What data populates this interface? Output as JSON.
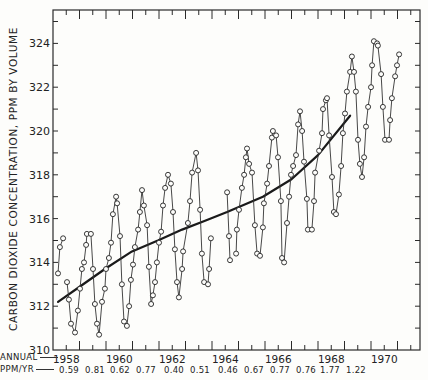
{
  "chart_data": {
    "type": "line",
    "title": "",
    "ylabel": "CARBON DIOXIDE CONCENTRATION, PPM BY VOLUME",
    "xlabel": "",
    "ylim": [
      310,
      325.5
    ],
    "xlim": [
      1958.0,
      1971.85
    ],
    "yticks": [
      310,
      312,
      314,
      316,
      318,
      320,
      322,
      324
    ],
    "xtick_labels": [
      "1958",
      "1960",
      "1962",
      "1964",
      "1966",
      "1968",
      "1970"
    ],
    "bottom_rows": {
      "annual_label": "ANNUAL",
      "rate_label": "PPM/YR",
      "rates": [
        "0.59",
        "0.81",
        "0.62",
        "0.77",
        "0.40",
        "0.51",
        "0.46",
        "0.67",
        "0.77",
        "0.76",
        "1.77",
        "1.22"
      ]
    },
    "grid": false,
    "series": [
      {
        "name": "Monthly mean CO2 (Mauna Loa)",
        "style": "line-open-circles",
        "segments": [
          [
            [
              1958.19,
              313.5
            ],
            [
              1958.26,
              314.7
            ],
            [
              1958.38,
              315.1
            ]
          ],
          [
            [
              1958.53,
              313.1
            ],
            [
              1958.6,
              312.3
            ],
            [
              1958.68,
              311.2
            ],
            [
              1958.83,
              310.8
            ],
            [
              1958.94,
              311.8
            ],
            [
              1959.02,
              312.8
            ],
            [
              1959.09,
              313.7
            ],
            [
              1959.17,
              314.0
            ],
            [
              1959.25,
              314.8
            ],
            [
              1959.28,
              315.3
            ],
            [
              1959.43,
              315.3
            ],
            [
              1959.51,
              313.7
            ],
            [
              1959.58,
              312.1
            ],
            [
              1959.66,
              311.2
            ],
            [
              1959.74,
              310.7
            ],
            [
              1959.85,
              312.2
            ],
            [
              1959.96,
              312.8
            ],
            [
              1960.0,
              313.7
            ],
            [
              1960.11,
              314.2
            ],
            [
              1960.19,
              314.9
            ],
            [
              1960.26,
              316.2
            ],
            [
              1960.38,
              317.0
            ],
            [
              1960.42,
              316.7
            ],
            [
              1960.53,
              315.2
            ],
            [
              1960.6,
              313.0
            ],
            [
              1960.68,
              311.3
            ],
            [
              1960.79,
              311.1
            ],
            [
              1960.87,
              312.0
            ],
            [
              1960.94,
              313.2
            ],
            [
              1961.02,
              313.9
            ],
            [
              1961.09,
              314.7
            ],
            [
              1961.21,
              315.5
            ],
            [
              1961.28,
              316.3
            ],
            [
              1961.36,
              317.3
            ],
            [
              1961.43,
              316.6
            ],
            [
              1961.55,
              315.7
            ],
            [
              1961.62,
              313.8
            ],
            [
              1961.7,
              312.1
            ],
            [
              1961.77,
              312.5
            ],
            [
              1961.85,
              313.1
            ],
            [
              1961.92,
              314.0
            ],
            [
              1962.0,
              314.9
            ],
            [
              1962.08,
              315.4
            ],
            [
              1962.15,
              316.6
            ],
            [
              1962.23,
              317.4
            ],
            [
              1962.34,
              318.0
            ],
            [
              1962.45,
              317.6
            ],
            [
              1962.53,
              316.3
            ],
            [
              1962.6,
              314.6
            ],
            [
              1962.68,
              313.1
            ],
            [
              1962.75,
              312.4
            ],
            [
              1962.87,
              313.7
            ],
            [
              1962.91,
              314.5
            ],
            [
              1963.09,
              315.8
            ],
            [
              1963.17,
              316.8
            ],
            [
              1963.25,
              318.1
            ],
            [
              1963.4,
              319.0
            ],
            [
              1963.47,
              318.2
            ],
            [
              1963.55,
              316.4
            ],
            [
              1963.62,
              314.4
            ],
            [
              1963.7,
              313.1
            ],
            [
              1963.85,
              313.0
            ],
            [
              1963.89,
              313.7
            ],
            [
              1963.96,
              315.1
            ]
          ],
          [
            [
              1964.57,
              317.2
            ],
            [
              1964.64,
              315.2
            ],
            [
              1964.68,
              314.1
            ]
          ],
          [
            [
              1964.91,
              314.4
            ],
            [
              1964.94,
              315.5
            ],
            [
              1965.02,
              316.4
            ],
            [
              1965.13,
              317.4
            ],
            [
              1965.21,
              318.0
            ],
            [
              1965.28,
              318.8
            ],
            [
              1965.32,
              319.2
            ],
            [
              1965.4,
              318.5
            ],
            [
              1965.51,
              318.1
            ],
            [
              1965.62,
              315.7
            ],
            [
              1965.7,
              314.4
            ],
            [
              1965.81,
              314.3
            ],
            [
              1965.92,
              315.6
            ],
            [
              1965.96,
              316.7
            ],
            [
              1966.08,
              317.6
            ],
            [
              1966.15,
              318.4
            ],
            [
              1966.26,
              319.7
            ],
            [
              1966.3,
              320.0
            ],
            [
              1966.42,
              319.8
            ],
            [
              1966.49,
              318.8
            ],
            [
              1966.6,
              316.8
            ],
            [
              1966.64,
              314.2
            ],
            [
              1966.72,
              314.0
            ],
            [
              1966.83,
              315.8
            ],
            [
              1966.91,
              317.0
            ],
            [
              1966.98,
              318.0
            ],
            [
              1967.06,
              318.4
            ],
            [
              1967.17,
              318.9
            ],
            [
              1967.25,
              320.3
            ],
            [
              1967.32,
              320.9
            ],
            [
              1967.4,
              320.0
            ],
            [
              1967.47,
              318.6
            ],
            [
              1967.58,
              316.9
            ],
            [
              1967.62,
              315.5
            ],
            [
              1967.77,
              315.5
            ],
            [
              1967.85,
              316.8
            ],
            [
              1967.89,
              318.1
            ],
            [
              1968.04,
              319.1
            ],
            [
              1968.15,
              319.9
            ],
            [
              1968.19,
              321.0
            ],
            [
              1968.3,
              321.4
            ],
            [
              1968.34,
              321.5
            ],
            [
              1968.42,
              319.8
            ],
            [
              1968.53,
              317.9
            ],
            [
              1968.6,
              316.3
            ],
            [
              1968.68,
              316.2
            ],
            [
              1968.79,
              317.1
            ],
            [
              1968.87,
              318.4
            ],
            [
              1968.94,
              319.9
            ],
            [
              1969.02,
              320.8
            ],
            [
              1969.09,
              321.8
            ],
            [
              1969.21,
              322.7
            ],
            [
              1969.28,
              323.4
            ],
            [
              1969.36,
              322.7
            ],
            [
              1969.43,
              321.8
            ],
            [
              1969.51,
              319.6
            ],
            [
              1969.58,
              318.5
            ],
            [
              1969.66,
              317.9
            ],
            [
              1969.74,
              318.8
            ],
            [
              1969.81,
              320.2
            ],
            [
              1969.89,
              321.1
            ],
            [
              1970.0,
              322.0
            ],
            [
              1970.04,
              323.0
            ],
            [
              1970.11,
              324.1
            ],
            [
              1970.23,
              324.0
            ],
            [
              1970.26,
              323.9
            ],
            [
              1970.38,
              322.6
            ],
            [
              1970.45,
              321.1
            ],
            [
              1970.53,
              319.6
            ],
            [
              1970.68,
              319.6
            ],
            [
              1970.72,
              320.5
            ],
            [
              1970.79,
              321.5
            ],
            [
              1970.91,
              322.5
            ],
            [
              1970.98,
              323.0
            ],
            [
              1971.06,
              323.5
            ]
          ]
        ]
      },
      {
        "name": "Trend (smoothed)",
        "style": "thick-line",
        "points": [
          [
            1958.19,
            312.2
          ],
          [
            1959.02,
            312.9
          ],
          [
            1959.96,
            313.7
          ],
          [
            1960.98,
            314.5
          ],
          [
            1961.96,
            315.0
          ],
          [
            1962.87,
            315.5
          ],
          [
            1963.74,
            315.9
          ],
          [
            1964.57,
            316.3
          ],
          [
            1965.92,
            317.0
          ],
          [
            1967.0,
            317.8
          ],
          [
            1968.0,
            318.9
          ],
          [
            1969.21,
            320.7
          ]
        ]
      }
    ]
  }
}
